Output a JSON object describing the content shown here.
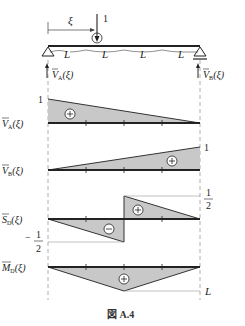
{
  "figure": {
    "caption": "図 A.4",
    "caption_prefix": "図",
    "caption_id": "A.4"
  },
  "beam": {
    "span_labels": [
      "L",
      "L",
      "L",
      "L"
    ],
    "load_label": "1",
    "position_label": "ξ",
    "reaction_a": "V̄A(ξ)",
    "reaction_b": "V̄B(ξ)"
  },
  "diagrams": [
    {
      "name": "VA",
      "label": "V̄A(ξ)",
      "sign": "+",
      "value_labels": [
        "1"
      ]
    },
    {
      "name": "VB",
      "label": "V̄B(ξ)",
      "sign": "+",
      "value_labels": [
        "1"
      ]
    },
    {
      "name": "SD",
      "label": "S̄D(ξ)",
      "signs": [
        "−",
        "+"
      ],
      "value_labels": [
        "1/2",
        "−1/2"
      ]
    },
    {
      "name": "MD",
      "label": "M̄D(ξ)",
      "sign": "+",
      "value_labels": [
        "L"
      ]
    }
  ],
  "text": {
    "one": "1",
    "half_num": "1",
    "half_den": "2",
    "minus": "−",
    "L": "L",
    "xi": "ξ",
    "V": "V",
    "S": "S",
    "M": "M",
    "sub_A": "A",
    "sub_B": "B",
    "sub_D": "D",
    "arg": "(ξ)",
    "plus_sign": "+",
    "minus_sign": "−"
  },
  "colors": {
    "fill": "#c8c8c8",
    "line": "#2a2a2a",
    "dash": "#888888"
  }
}
